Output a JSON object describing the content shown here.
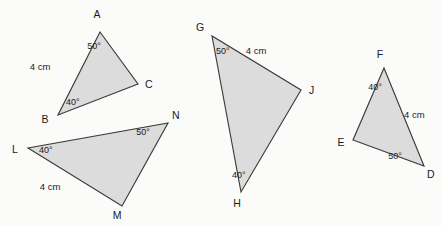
{
  "figure": {
    "type": "geometry-diagram",
    "background_color": "#fbfbfa",
    "fill_color": "#dcdcdc",
    "stroke_color": "#3a3a3a",
    "canvas": {
      "width": 441,
      "height": 227
    },
    "triangles": [
      {
        "id": "ABC",
        "vertices": [
          {
            "label": "A",
            "x": 100,
            "y": 32,
            "label_x": 97,
            "label_y": 18
          },
          {
            "label": "B",
            "x": 58,
            "y": 115,
            "label_x": 45,
            "label_y": 123
          },
          {
            "label": "C",
            "x": 138,
            "y": 84,
            "label_x": 145,
            "label_y": 88
          }
        ],
        "angles": [
          {
            "vertex": "A",
            "value": "50°",
            "x": 94,
            "y": 49
          },
          {
            "vertex": "B",
            "value": "40°",
            "x": 66,
            "y": 105
          }
        ],
        "sides": [
          {
            "between": "AB",
            "value": "4 cm",
            "x": 40,
            "y": 70
          }
        ]
      },
      {
        "id": "LMN",
        "vertices": [
          {
            "label": "L",
            "x": 28,
            "y": 148,
            "label_x": 15,
            "label_y": 153
          },
          {
            "label": "M",
            "x": 122,
            "y": 206,
            "label_x": 117,
            "label_y": 219
          },
          {
            "label": "N",
            "x": 168,
            "y": 123,
            "label_x": 172,
            "label_y": 119
          }
        ],
        "angles": [
          {
            "vertex": "L",
            "value": "40°",
            "x": 39,
            "y": 153
          },
          {
            "vertex": "N",
            "value": "50°",
            "x": 143,
            "y": 135
          }
        ],
        "sides": [
          {
            "between": "LM",
            "value": "4 cm",
            "x": 50,
            "y": 190
          }
        ]
      },
      {
        "id": "GHJ",
        "vertices": [
          {
            "label": "G",
            "x": 212,
            "y": 36,
            "label_x": 200,
            "label_y": 31
          },
          {
            "label": "H",
            "x": 241,
            "y": 192,
            "label_x": 237,
            "label_y": 207
          },
          {
            "label": "J",
            "x": 301,
            "y": 90,
            "label_x": 309,
            "label_y": 94
          }
        ],
        "angles": [
          {
            "vertex": "G",
            "value": "50°",
            "x": 216,
            "y": 54
          },
          {
            "vertex": "H",
            "value": "40°",
            "x": 232,
            "y": 178
          }
        ],
        "sides": [
          {
            "between": "GJ",
            "value": "4 cm",
            "x": 256,
            "y": 54
          }
        ]
      },
      {
        "id": "DEF",
        "vertices": [
          {
            "label": "F",
            "x": 384,
            "y": 68,
            "label_x": 380,
            "label_y": 58
          },
          {
            "label": "E",
            "x": 353,
            "y": 140,
            "label_x": 341,
            "label_y": 146
          },
          {
            "label": "D",
            "x": 424,
            "y": 166,
            "label_x": 427,
            "label_y": 178
          }
        ],
        "angles": [
          {
            "vertex": "F",
            "value": "40°",
            "x": 375,
            "y": 90
          },
          {
            "vertex": "D",
            "value": "50°",
            "x": 395,
            "y": 159
          }
        ],
        "sides": [
          {
            "between": "FD",
            "value": "4 cm",
            "x": 404,
            "y": 118
          }
        ]
      }
    ]
  }
}
